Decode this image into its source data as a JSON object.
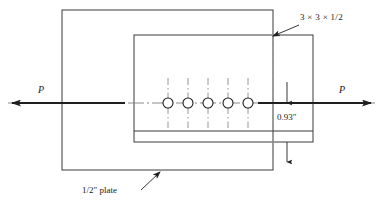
{
  "figure": {
    "background_color": "#ffffff",
    "line_color": "#2b2b2b",
    "centerline_color": "#6b6b6b",
    "dashed_color": "#8c8c8c",
    "text_color": "#1a1a1a",
    "width": 383,
    "height": 207
  },
  "labels": {
    "force_left": "P",
    "force_right": "P",
    "angle_spec": "3 × 3 × 1/2",
    "edge_distance": "0.93″",
    "plate_spec": "1/2″ plate"
  },
  "geometry": {
    "outer_plate": {
      "x": 62,
      "y": 10,
      "width": 211,
      "height": 160
    },
    "angle_section": {
      "x": 134,
      "y": 35,
      "width": 179,
      "height": 107
    },
    "angle_leg_line_y": 131,
    "dashed_cut_line": {
      "x": 273,
      "y1": 33,
      "y2": 156
    },
    "axis_centerline_y": 103,
    "axis_centerline": {
      "x1": 8,
      "x2": 375
    },
    "bolts": {
      "count": 5,
      "radius": 5,
      "center_y": 103,
      "centers_x": [
        168,
        188,
        208,
        228,
        248
      ],
      "gauge_line_top": 78,
      "gauge_line_bottom": 128
    },
    "dimension": {
      "x": 287,
      "top_y": 103,
      "bottom_y": 142,
      "upper_leader_from": 82,
      "lower_leader_to": 162
    },
    "arrow_left": {
      "x1": 125,
      "x2": 10,
      "y": 103
    },
    "arrow_right": {
      "x1": 258,
      "x2": 373,
      "y": 103
    },
    "leader_angle_spec": {
      "x1": 298,
      "y1": 25,
      "x2": 272,
      "y2": 36
    },
    "leader_plate_spec": {
      "x1": 142,
      "y1": 190,
      "x2": 159,
      "y2": 173
    }
  },
  "label_positions": {
    "force_left": {
      "x": 38,
      "y": 89
    },
    "force_right": {
      "x": 339,
      "y": 89
    },
    "angle_spec": {
      "x": 300,
      "y": 16
    },
    "edge_distance": {
      "x": 277,
      "y": 117
    },
    "plate_spec": {
      "x": 85,
      "y": 188
    }
  }
}
